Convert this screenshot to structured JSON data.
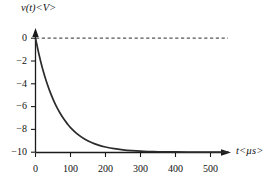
{
  "chart_data": {
    "type": "line",
    "title": "",
    "subtitle": "",
    "xlabel": "t<µs>",
    "ylabel": "v(t)<V>",
    "xlim": [
      0,
      550
    ],
    "ylim": [
      -10,
      0
    ],
    "grid": false,
    "legend": null,
    "xticks": [
      0,
      100,
      200,
      300,
      400,
      500
    ],
    "xtick_labels": [
      "0",
      "100",
      "200",
      "300",
      "400",
      "500"
    ],
    "yticks": [
      0,
      -2,
      -4,
      -6,
      -8,
      -10
    ],
    "ytick_labels": [
      "0",
      "−2",
      "−4",
      "−6",
      "−8",
      "−10"
    ],
    "series": [
      {
        "name": "v(t)",
        "equation": "v(t) = -10(1 - e^(-t/65))",
        "color": "#2b2b2b",
        "x": [
          0,
          10,
          20,
          30,
          40,
          50,
          60,
          70,
          80,
          90,
          100,
          120,
          140,
          160,
          180,
          200,
          225,
          250,
          275,
          300,
          325,
          350,
          375,
          400,
          450,
          500,
          550
        ],
        "y": [
          0,
          -1.43,
          -2.65,
          -3.69,
          -4.58,
          -5.34,
          -6.0,
          -6.56,
          -7.05,
          -7.47,
          -7.84,
          -8.42,
          -8.84,
          -9.15,
          -9.38,
          -9.54,
          -9.69,
          -9.79,
          -9.86,
          -9.91,
          -9.94,
          -9.96,
          -9.97,
          -9.98,
          -9.99,
          -10.0,
          -10.0
        ]
      }
    ],
    "annotations": [
      {
        "name": "zero-reference-line",
        "type": "dashed-horizontal",
        "y": 0,
        "x_start": 0,
        "x_end": 550,
        "color": "#555555"
      }
    ],
    "axis_arrows": {
      "x": "right",
      "y": "up"
    }
  }
}
